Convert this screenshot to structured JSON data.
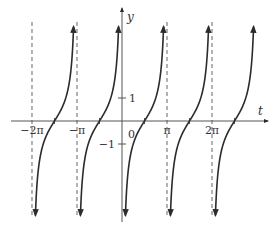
{
  "chart_data": {
    "type": "line",
    "title": "",
    "function": "y = -cot(t)",
    "xlabel": "t",
    "ylabel": "y",
    "x_ticks": [
      {
        "value": -6.2832,
        "label": "−2π"
      },
      {
        "value": -3.1416,
        "label": "−π"
      },
      {
        "value": 0,
        "label": "0"
      },
      {
        "value": 3.1416,
        "label": "π"
      },
      {
        "value": 6.2832,
        "label": "2π"
      }
    ],
    "y_ticks": [
      {
        "value": 1,
        "label": "1"
      },
      {
        "value": -1,
        "label": "−1"
      }
    ],
    "asymptotes_x": [
      -6.2832,
      -3.1416,
      3.1416,
      6.2832
    ],
    "branches": [
      {
        "from": -6.2832,
        "to": -3.1416,
        "zero_at": -4.7124
      },
      {
        "from": -3.1416,
        "to": 0,
        "zero_at": -1.5708
      },
      {
        "from": 0,
        "to": 3.1416,
        "zero_at": 1.5708
      },
      {
        "from": 3.1416,
        "to": 6.2832,
        "zero_at": 4.7124
      },
      {
        "from": 6.2832,
        "to": 9.4248,
        "zero_at": 7.854
      }
    ],
    "xlim": [
      -7.0,
      10.2
    ],
    "ylim": [
      -4.2,
      4.3
    ],
    "grid": false,
    "legend": null,
    "colors": {
      "curve": "#2b2b2b",
      "axis": "#555555",
      "asymptote": "#666666"
    }
  }
}
